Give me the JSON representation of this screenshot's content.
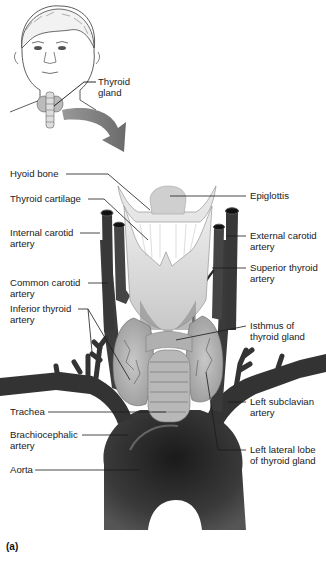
{
  "figure": {
    "panel_label": "(a)",
    "inset": {
      "thyroid_label": "Thyroid\ngland"
    },
    "labels_left": [
      {
        "id": "hyoid-bone",
        "text": "Hyoid bone"
      },
      {
        "id": "thyroid-cartilage",
        "text": "Thyroid cartilage"
      },
      {
        "id": "internal-carotid-artery",
        "text": "Internal carotid\nartery"
      },
      {
        "id": "common-carotid-artery",
        "text": "Common carotid\nartery"
      },
      {
        "id": "inferior-thyroid-artery",
        "text": "Inferior thyroid\nartery"
      },
      {
        "id": "trachea",
        "text": "Trachea"
      },
      {
        "id": "brachiocephalic-artery",
        "text": "Brachiocephalic\nartery"
      },
      {
        "id": "aorta",
        "text": "Aorta"
      }
    ],
    "labels_right": [
      {
        "id": "epiglottis",
        "text": "Epiglottis"
      },
      {
        "id": "external-carotid-artery",
        "text": "External carotid\nartery"
      },
      {
        "id": "superior-thyroid-artery",
        "text": "Superior thyroid\nartery"
      },
      {
        "id": "isthmus-of-thyroid-gland",
        "text": "Isthmus of\nthyroid gland"
      },
      {
        "id": "left-subclavian-artery",
        "text": "Left subclavian\nartery"
      },
      {
        "id": "left-lateral-lobe-of-thyroid-gland",
        "text": "Left lateral lobe\nof thyroid gland"
      }
    ],
    "colors": {
      "vessel": "#3a3a3a",
      "vessel_dark": "#1e1e1e",
      "gland": "#b4b4b4",
      "cartilage": "#d9d9d9",
      "arrow": "#7a7a7a",
      "leader": "#222222"
    }
  }
}
